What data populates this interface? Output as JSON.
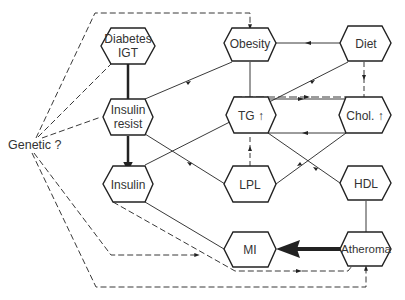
{
  "diagram": {
    "type": "causal-flow",
    "nodes": {
      "diabetes": {
        "label": "Diabetes\nIGT",
        "line1": "Diabetes",
        "line2": "IGT"
      },
      "obesity": {
        "label": "Obesity"
      },
      "diet": {
        "label": "Diet"
      },
      "insulin_resist": {
        "label": "Insulin\nresist",
        "line1": "Insulin",
        "line2": "resist"
      },
      "tg": {
        "label": "TG ↑",
        "text": "TG",
        "arrow": "↑"
      },
      "chol": {
        "label": "Chol. ↑",
        "text": "Chol.",
        "arrow": "↑"
      },
      "insulin": {
        "label": "Insulin"
      },
      "lpl": {
        "label": "LPL"
      },
      "hdl": {
        "label": "HDL"
      },
      "mi": {
        "label": "MI"
      },
      "atheroma": {
        "label": "Atheroma"
      },
      "genetic": {
        "label": "Genetic ?"
      }
    },
    "edges": [
      {
        "from": "Genetic ?",
        "to": "Obesity",
        "style": "dashed"
      },
      {
        "from": "Genetic ?",
        "to": "Diabetes IGT",
        "style": "dashed"
      },
      {
        "from": "Genetic ?",
        "to": "Insulin resist",
        "style": "dashed"
      },
      {
        "from": "Genetic ?",
        "to": "MI",
        "style": "dashed"
      },
      {
        "from": "Genetic ?",
        "to": "Atheroma",
        "style": "dashed"
      },
      {
        "from": "Diabetes IGT",
        "to": "Insulin resist",
        "style": "thick"
      },
      {
        "from": "Insulin resist",
        "to": "Insulin",
        "style": "thick"
      },
      {
        "from": "Obesity",
        "to": "Insulin resist",
        "style": "solid"
      },
      {
        "from": "Diet",
        "to": "Obesity",
        "style": "solid"
      },
      {
        "from": "Diet",
        "to": "Chol. ↑",
        "style": "dashed"
      },
      {
        "from": "Diet",
        "to": "Insulin",
        "style": "solid"
      },
      {
        "from": "Obesity",
        "to": "TG ↑",
        "style": "solid"
      },
      {
        "from": "TG ↑",
        "to": "Chol. ↑",
        "style": "solid"
      },
      {
        "from": "Chol. ↑",
        "to": "TG ↑",
        "style": "solid"
      },
      {
        "from": "Insulin resist",
        "to": "LPL",
        "style": "solid"
      },
      {
        "from": "LPL",
        "to": "TG ↑",
        "style": "dashed"
      },
      {
        "from": "LPL",
        "to": "Chol. ↑",
        "style": "solid"
      },
      {
        "from": "TG ↑",
        "to": "HDL",
        "style": "solid"
      },
      {
        "from": "HDL",
        "to": "Atheroma",
        "style": "solid"
      },
      {
        "from": "Atheroma",
        "to": "MI",
        "style": "thick"
      },
      {
        "from": "Insulin",
        "to": "MI",
        "style": "solid"
      },
      {
        "from": "Insulin",
        "to": "Atheroma",
        "style": "dashed"
      }
    ]
  }
}
